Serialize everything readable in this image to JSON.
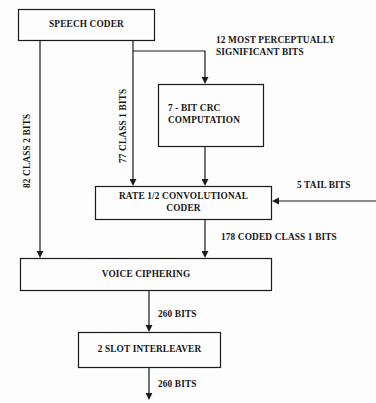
{
  "diagram": {
    "background_color": "#fdfdfd",
    "line_color": "#1a1a1a",
    "text_color": "#151515",
    "blocks": [
      {
        "id": "speech_coder",
        "label": "SPEECH CODER"
      },
      {
        "id": "crc",
        "label": "7 - BIT CRC\nCOMPUTATION"
      },
      {
        "id": "conv_coder",
        "label": "RATE 1/2 CONVOLUTIONAL\nCODER"
      },
      {
        "id": "voice_ciphering",
        "label": "VOICE CIPHERING"
      },
      {
        "id": "interleaver",
        "label": "2 SLOT INTERLEAVER"
      }
    ],
    "edge_labels": [
      {
        "id": "class2",
        "text": "82 CLASS 2 BITS"
      },
      {
        "id": "class1",
        "text": "77 CLASS 1 BITS"
      },
      {
        "id": "msb",
        "text": "12 MOST PERCEPTUALLY\nSIGNIFICANT BITS"
      },
      {
        "id": "tail",
        "text": "5 TAIL BITS"
      },
      {
        "id": "coded_class1",
        "text": "178 CODED CLASS 1 BITS"
      },
      {
        "id": "bits260_in",
        "text": "260 BITS"
      },
      {
        "id": "bits260_out",
        "text": "260 BITS"
      }
    ]
  }
}
